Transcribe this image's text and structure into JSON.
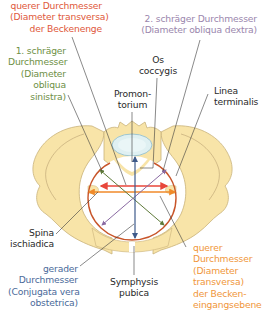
{
  "colors": {
    "bone_fill": "#f8e4a8",
    "bone_outline": "#c9b27a",
    "disc_fill": "#dff0f2",
    "disc_outline": "#9fc6cf",
    "inlet_outline": "#c8552a",
    "transverse_outlet": "#e8463a",
    "transverse_inlet": "#f08a2a",
    "oblique_1": "#5e7a3a",
    "oblique_2": "#8a6aa2",
    "conjugata": "#3d5a8a",
    "leader": "#3a3a3a",
    "text_dark": "#2a2a2a"
  },
  "labels": {
    "transverse_outlet": {
      "lines": [
        "querer Durchmesser",
        "(Diameter transversa)",
        "der Beckenenge"
      ],
      "color": "#e0583a"
    },
    "oblique_2": {
      "lines": [
        "2. schräger Durchmesser",
        "(Diameter obliqua dextra)"
      ],
      "color": "#9a86ad"
    },
    "oblique_1": {
      "lines": [
        "1. schräger",
        "Durchmesser",
        "(Diameter",
        "obliqua",
        "sinistra)"
      ],
      "color": "#6e8f45"
    },
    "os_coccygis": {
      "lines": [
        "Os",
        "coccygis"
      ],
      "color": "#2a2a2a"
    },
    "promontorium": {
      "lines": [
        "Promon-",
        "torium"
      ],
      "color": "#2a2a2a"
    },
    "linea_terminalis": {
      "lines": [
        "Linea",
        "terminalis"
      ],
      "color": "#2a2a2a"
    },
    "spina_ischiadica": {
      "lines": [
        "Spina",
        "ischiadica"
      ],
      "color": "#2a2a2a"
    },
    "conjugata": {
      "lines": [
        "gerader",
        "Durchmesser",
        "(Conjugata vera",
        "obstetrica)"
      ],
      "color": "#4a6a9a"
    },
    "symphysis": {
      "lines": [
        "Symphysis",
        "pubica"
      ],
      "color": "#2a2a2a"
    },
    "transverse_inlet": {
      "lines": [
        "querer",
        "Durchmesser",
        "(Diameter",
        "transversa)",
        "der Becken-",
        "eingangsebene"
      ],
      "color": "#f0963a"
    }
  }
}
